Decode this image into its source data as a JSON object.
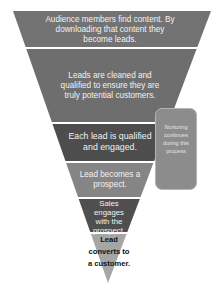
{
  "diagram": {
    "type": "funnel",
    "stages": [
      {
        "label": "Audience members find content. By downloading that content they become leads.",
        "color": "#737373"
      },
      {
        "label": "Leads are cleaned and qualified to ensure they are truly potential customers.",
        "color": "#6e6e6e"
      },
      {
        "label": "Each lead is qualified and engaged.",
        "color": "#4d4d4d"
      },
      {
        "label": "Lead becomes a prospect.",
        "color": "#858585"
      },
      {
        "label": "Sales engages with the prospect.",
        "color": "#4f4f4f"
      },
      {
        "label": "Lead converts to a customer.",
        "color": "#a6a6a6"
      }
    ],
    "side_note": {
      "label": "Nurturing continues during this process",
      "color": "#8c8c8c"
    },
    "divider_color": "#e8e8e8"
  }
}
